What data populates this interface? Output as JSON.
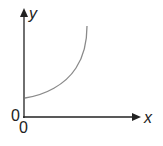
{
  "diagram": {
    "type": "graph-sketch",
    "axes": {
      "x_label": "x",
      "y_label": "y",
      "origin_label_y": "0",
      "origin_label_x": "0"
    },
    "curve": {
      "description": "increasing, concave-up curve starting at positive y-intercept",
      "color": "#8a8a8a"
    },
    "axis_color": "#222222"
  }
}
